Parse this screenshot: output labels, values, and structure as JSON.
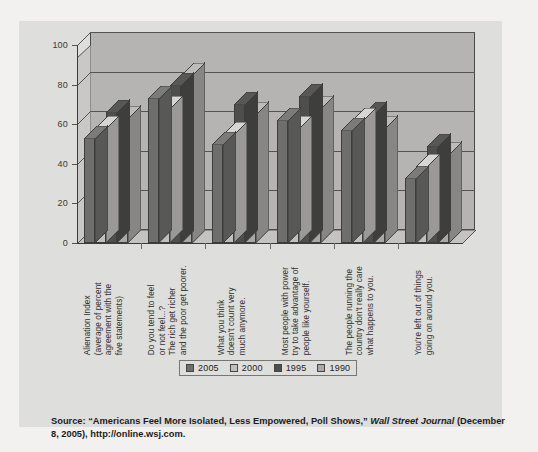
{
  "colors": {
    "page_background": "#f2f1ef",
    "card_background": "#dededd",
    "plot_wall": "#b5b4b2",
    "axis": "#3b3b39",
    "series_2005": "#6e6e6c",
    "series_2000": "#c0bfbd",
    "series_1995": "#4e4e4c",
    "series_1990": "#a9a8a6"
  },
  "chart_data": {
    "type": "bar",
    "title": "",
    "xlabel": "",
    "ylabel": "",
    "ylim": [
      0,
      100
    ],
    "yticks": [
      0,
      20,
      40,
      60,
      80,
      100
    ],
    "ytick_labels": [
      "0",
      "20",
      "40",
      "60",
      "80",
      "100"
    ],
    "grid": true,
    "legend_position": "bottom",
    "categories": [
      "Alienation Index (average of percent agreement with the five statements)",
      "Do you tend to feel or not feel...? The rich get richer and the poor get poorer.",
      "What you think doesn't count very much anymore.",
      "Most people with power try to take advantage of people like yourself.",
      "The people running the country don't really care what happens to you.",
      "You're left out of things going on around you."
    ],
    "category_lines": [
      [
        "Alienation Index",
        "(average of percent",
        "agreement with the",
        "five statements)"
      ],
      [
        "Do you tend to feel",
        "or not feel...?",
        "The rich get richer",
        "and the poor get poorer."
      ],
      [
        "What you think",
        "doesn't count very",
        "much anymore."
      ],
      [
        "Most people with power",
        "try to take advantage of",
        "people like yourself."
      ],
      [
        "The people running the",
        "country don't really care",
        "what happens to you."
      ],
      [
        "You're left out of things",
        "going on around you."
      ]
    ],
    "series": [
      {
        "name": "2005",
        "color": "#6e6e6c",
        "values": [
          53,
          73,
          50,
          62,
          57,
          33
        ]
      },
      {
        "name": "2000",
        "color": "#c0bfbd",
        "values": [
          58,
          68,
          55,
          58,
          62,
          39
        ]
      },
      {
        "name": "1995",
        "color": "#4e4e4c",
        "values": [
          66,
          80,
          70,
          74,
          65,
          49
        ]
      },
      {
        "name": "1990",
        "color": "#a9a8a6",
        "values": [
          63,
          85,
          65,
          68,
          58,
          45
        ]
      }
    ]
  },
  "legend": {
    "items": [
      {
        "label": "2005",
        "color": "#6e6e6c"
      },
      {
        "label": "2000",
        "color": "#c0bfbd"
      },
      {
        "label": "1995",
        "color": "#4e4e4c"
      },
      {
        "label": "1990",
        "color": "#a9a8a6"
      }
    ]
  },
  "source": {
    "prefix": "Source: “Americans Feel More Isolated, Less Empowered, Poll Shows,” ",
    "publication": "Wall Street Journal",
    "suffix": " (December 8, 2005), http://online.wsj.com."
  }
}
